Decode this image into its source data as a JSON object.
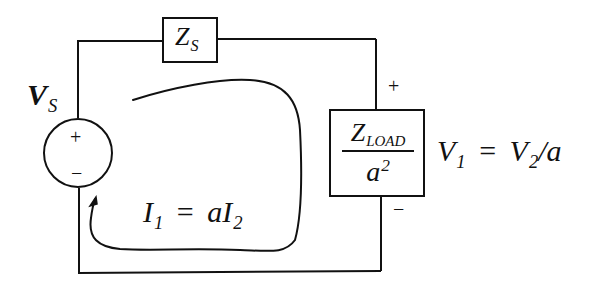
{
  "diagram": {
    "type": "circuit",
    "stroke_color": "#111111",
    "background": "#ffffff"
  },
  "source": {
    "label_main": "V",
    "label_sub": "S",
    "plus": "+",
    "minus": "−"
  },
  "source_impedance": {
    "label_main": "Z",
    "label_sub": "S"
  },
  "load": {
    "numerator_main": "Z",
    "numerator_sub": "LOAD",
    "denominator_main": "a",
    "denominator_sup": "2",
    "plus": "+",
    "minus": "−"
  },
  "voltage_equation": {
    "lhs_main": "V",
    "lhs_sub": "1",
    "equals": "=",
    "rhs_main": "V",
    "rhs_sub": "2",
    "rhs_tail": "/a"
  },
  "current_equation": {
    "lhs_main": "I",
    "lhs_sub": "1",
    "equals": "=",
    "rhs_coef": "a",
    "rhs_main": "I",
    "rhs_sub": "2"
  }
}
